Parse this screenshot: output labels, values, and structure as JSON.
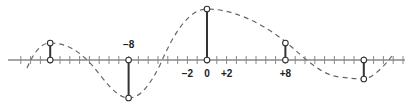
{
  "diagram": {
    "axis": {
      "x_start_px": 8,
      "x_end_px": 405,
      "y_px": 60,
      "origin_px": 207,
      "px_per_unit": 9.8,
      "tick_min": -20,
      "tick_max": 20,
      "color": "#888888"
    },
    "tick_labels": [
      {
        "value": -8,
        "text": "−8",
        "position": "above"
      },
      {
        "value": -2,
        "text": "−2",
        "position": "below"
      },
      {
        "value": 0,
        "text": "0",
        "position": "below"
      },
      {
        "value": 2,
        "text": "+2",
        "position": "below"
      },
      {
        "value": 8,
        "text": "+8",
        "position": "below"
      }
    ],
    "samples": [
      {
        "x": -16,
        "amplitude_px": 17
      },
      {
        "x": -8,
        "amplitude_px": -38
      },
      {
        "x": 0,
        "amplitude_px": 51
      },
      {
        "x": 8,
        "amplitude_px": 17
      },
      {
        "x": 16,
        "amplitude_px": -19
      }
    ],
    "curve": {
      "style": "dashed",
      "color": "#666666",
      "path": "M 27 68 C 35 50, 42 43, 50 43 C 70 43, 85 55, 100 75 C 112 90, 120 98, 129 98 C 140 98, 150 85, 160 65 C 175 30, 190 9, 207 9 C 235 9, 265 25, 287 43 C 305 58, 320 75, 340 77 C 355 79, 362 79, 366 79 C 376 75, 385 65, 392 56"
    },
    "stem_color": "#333333",
    "marker_fill": "#ffffff",
    "marker_stroke": "#333333"
  }
}
